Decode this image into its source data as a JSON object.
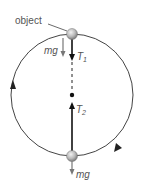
{
  "diagram": {
    "labels": {
      "object": "object",
      "mg_top": "mg",
      "t1_main": "T",
      "t1_sub": "1",
      "t2_main": "T",
      "t2_sub": "2",
      "mg_bottom": "mg"
    },
    "colors": {
      "circle": "#444444",
      "force_dark": "#111111",
      "force_gray": "#777777",
      "ball_fill": "#bbbbbb",
      "text": "#555555"
    },
    "geometry": {
      "center": [
        72,
        95
      ],
      "radius": 63,
      "top_ball": [
        72,
        34
      ],
      "bottom_ball": [
        72,
        156
      ]
    },
    "motion_direction": "counterclockwise"
  }
}
